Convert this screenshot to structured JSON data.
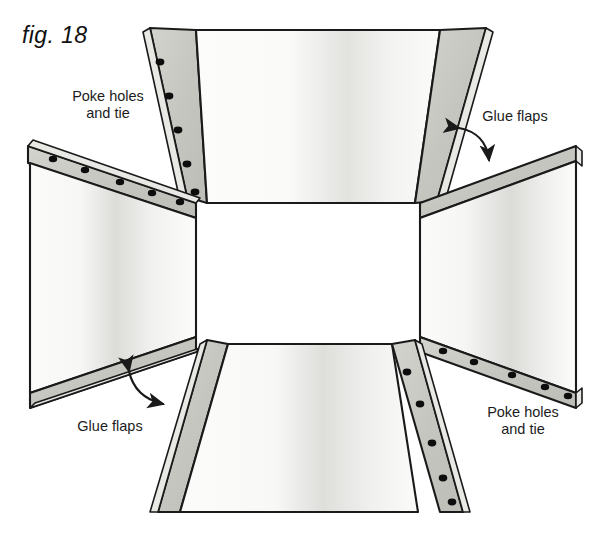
{
  "figure": {
    "caption": "fig. 18",
    "type": "papercraft-assembly-diagram"
  },
  "labels": [
    {
      "id": "poke-top-left",
      "text": "Poke holes\nand tie",
      "x": 52,
      "y": 88
    },
    {
      "id": "glue-top-right",
      "text": "Glue flaps",
      "x": 463,
      "y": 108
    },
    {
      "id": "glue-bottom-left",
      "text": "Glue flaps",
      "x": 58,
      "y": 418
    },
    {
      "id": "poke-bottom-right",
      "text": "Poke holes\nand tie",
      "x": 467,
      "y": 404
    }
  ],
  "colors": {
    "paper_light": "#fdfdfc",
    "paper_shade": "#d9d9d6",
    "flap_fill": "#c9c9c4",
    "outline": "#1a1a1a",
    "hole": "#0d0d0d",
    "text": "#1c1c1c",
    "background": "#ffffff"
  },
  "panels": [
    {
      "id": "panel-top",
      "shape": "trapezoid",
      "orientation": "top",
      "points": "196,30 440,30 415,203 207,203",
      "flaps": [
        {
          "id": "flap-top-left",
          "kind": "poke-holes",
          "holes": 5
        },
        {
          "id": "flap-top-right",
          "kind": "glue",
          "holes": 0
        }
      ]
    },
    {
      "id": "panel-left",
      "shape": "trapezoid",
      "orientation": "left",
      "points": "30,160 196,203 196,337 30,395",
      "flaps": [
        {
          "id": "flap-left-top",
          "kind": "poke-holes",
          "holes": 5
        },
        {
          "id": "flap-left-bottom",
          "kind": "glue",
          "holes": 0
        }
      ]
    },
    {
      "id": "panel-right",
      "shape": "trapezoid",
      "orientation": "right",
      "points": "420,203 578,160 578,395 420,337",
      "flaps": [
        {
          "id": "flap-right-top",
          "kind": "glue",
          "holes": 0
        },
        {
          "id": "flap-right-bottom",
          "kind": "poke-holes",
          "holes": 5
        }
      ]
    },
    {
      "id": "panel-bottom",
      "shape": "trapezoid",
      "orientation": "bottom",
      "points": "207,340 415,340 440,512 196,512",
      "flaps": [
        {
          "id": "flap-bottom-left",
          "kind": "glue",
          "holes": 0
        },
        {
          "id": "flap-bottom-right",
          "kind": "poke-holes",
          "holes": 5
        }
      ]
    }
  ],
  "arrows": [
    {
      "id": "arrow-glue-top-right",
      "style": "curved-double-headed"
    },
    {
      "id": "arrow-glue-bottom-left",
      "style": "curved-double-headed"
    }
  ]
}
